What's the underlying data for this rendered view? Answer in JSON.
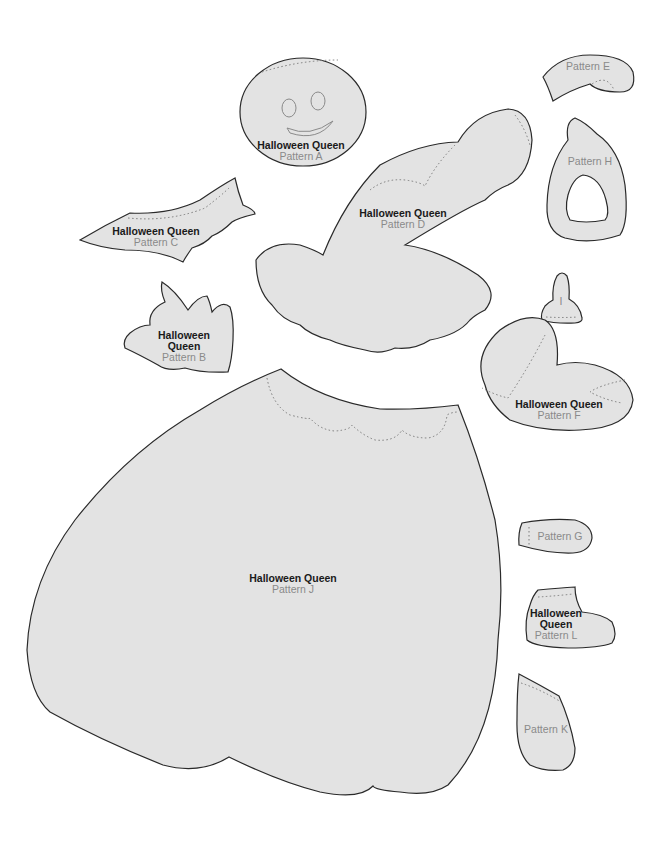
{
  "sheet": {
    "colors": {
      "piece_fill": "#e3e3e3",
      "outline": "#2a2a2a",
      "seam": "#7a7a7a",
      "title_text": "#1a1a1a",
      "pattern_text": "#8a8a8a"
    },
    "pieces": {
      "A": {
        "title": "Halloween Queen",
        "pattern": "Pattern A"
      },
      "B": {
        "title1": "Halloween",
        "title2": "Queen",
        "pattern": "Pattern B"
      },
      "C": {
        "title": "Halloween Queen",
        "pattern": "Pattern C"
      },
      "D": {
        "title": "Halloween Queen",
        "pattern": "Pattern D"
      },
      "E": {
        "pattern": "Pattern E"
      },
      "F": {
        "title": "Halloween Queen",
        "pattern": "Pattern F"
      },
      "G": {
        "pattern": "Pattern G"
      },
      "H": {
        "pattern": "Pattern H"
      },
      "I": {
        "pattern": "I"
      },
      "J": {
        "title": "Halloween Queen",
        "pattern": "Pattern J"
      },
      "K": {
        "pattern": "Pattern K"
      },
      "L": {
        "title1": "Halloween",
        "title2": "Queen",
        "pattern": "Pattern L"
      }
    }
  }
}
